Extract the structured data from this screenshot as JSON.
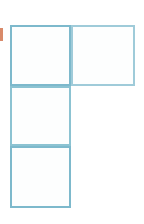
{
  "figure": {
    "background_color": "#ffffff",
    "stroke_color": "#7db9cc",
    "stroke_color_light": "#a9d2dd",
    "cell_fill_color": "#fdfefe",
    "stroke_width_px": 2,
    "cell_size_px": 61,
    "grid": {
      "columns": 2,
      "rows": 3,
      "origin_x_px": 10,
      "origin_y_px": 25,
      "occupancy": [
        [
          1,
          1
        ],
        [
          1,
          0
        ],
        [
          1,
          0
        ]
      ]
    },
    "cells": [
      {
        "id": "cell-r1c1",
        "label": "",
        "row": 1,
        "col": 1,
        "x": 10,
        "y": 25,
        "width": 61,
        "height": 61,
        "fill": "#fdfefe",
        "stroke": "#7db9cc"
      },
      {
        "id": "cell-r1c2",
        "label": "",
        "row": 1,
        "col": 2,
        "x": 71,
        "y": 25,
        "width": 64,
        "height": 61,
        "fill": "#fdfefe",
        "stroke": "#9fcbd9"
      },
      {
        "id": "cell-r2c1",
        "label": "",
        "row": 2,
        "col": 1,
        "x": 10,
        "y": 86,
        "width": 61,
        "height": 60,
        "fill": "#fdfefe",
        "stroke": "#8cc3d2"
      },
      {
        "id": "cell-r3c1",
        "label": "",
        "row": 3,
        "col": 1,
        "x": 10,
        "y": 146,
        "width": 61,
        "height": 62,
        "fill": "#fdfefe",
        "stroke": "#7db9cc"
      }
    ],
    "edge_marker": {
      "id": "left-edge-marker",
      "color": "#d98a6a",
      "x": 0,
      "y": 28,
      "width": 3,
      "height": 13,
      "note": "clipped accent sliver at the left image border"
    }
  }
}
